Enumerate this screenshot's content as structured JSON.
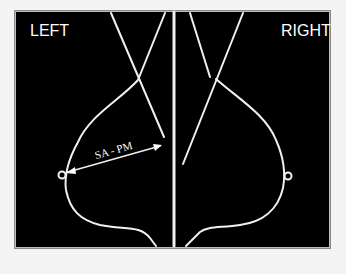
{
  "labels": {
    "left": "LEFT",
    "right": "RIGHT",
    "measurement": "SA - PM"
  },
  "colors": {
    "background": "#000000",
    "lines": "#f2f2f2",
    "page": "#f4f4f4"
  }
}
